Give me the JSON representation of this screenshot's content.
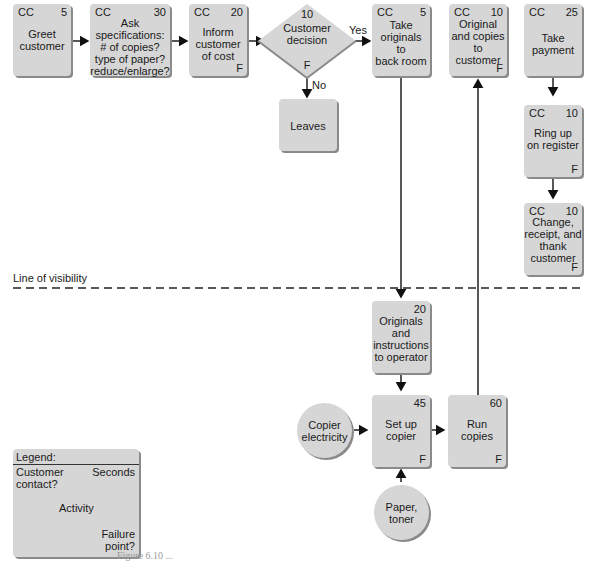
{
  "diagram": {
    "type": "service blueprint",
    "line_of_visibility_label": "Line of visibility",
    "nodes": [
      {
        "id": "greet",
        "cc": "CC",
        "seconds": "5",
        "label": "Greet\ncustomer",
        "failure": ""
      },
      {
        "id": "ask",
        "cc": "CC",
        "seconds": "30",
        "label": "Ask\nspecifications:\n# of copies?\ntype of paper?\nreduce/enlarge?",
        "failure": ""
      },
      {
        "id": "inform",
        "cc": "CC",
        "seconds": "20",
        "label": "Inform\ncustomer\nof cost",
        "failure": "F"
      },
      {
        "id": "decision",
        "cc": "",
        "seconds": "10",
        "label": "Customer\ndecision",
        "failure": "F"
      },
      {
        "id": "leaves",
        "cc": "",
        "seconds": "",
        "label": "Leaves",
        "failure": ""
      },
      {
        "id": "take_originals",
        "cc": "CC",
        "seconds": "5",
        "label": "Take\noriginals\nto\nback room",
        "failure": ""
      },
      {
        "id": "original_copies",
        "cc": "CC",
        "seconds": "10",
        "label": "Original\nand copies\nto\ncustomer",
        "failure": "F"
      },
      {
        "id": "take_payment",
        "cc": "CC",
        "seconds": "25",
        "label": "Take\npayment",
        "failure": ""
      },
      {
        "id": "ring_up",
        "cc": "CC",
        "seconds": "10",
        "label": "Ring up\non register",
        "failure": "F"
      },
      {
        "id": "change_receipt",
        "cc": "CC",
        "seconds": "10",
        "label": "Change,\nreceipt, and\nthank\ncustomer",
        "failure": "F"
      },
      {
        "id": "originals_operator",
        "cc": "",
        "seconds": "20",
        "label": "Originals\nand\ninstructions\nto operator",
        "failure": ""
      },
      {
        "id": "setup_copier",
        "cc": "",
        "seconds": "45",
        "label": "Set up\ncopier",
        "failure": "F"
      },
      {
        "id": "run_copies",
        "cc": "",
        "seconds": "60",
        "label": "Run\ncopies",
        "failure": "F"
      },
      {
        "id": "copier_electricity",
        "cc": "",
        "seconds": "",
        "label": "Copier\nelectricity",
        "failure": ""
      },
      {
        "id": "paper_toner",
        "cc": "",
        "seconds": "",
        "label": "Paper,\ntoner",
        "failure": ""
      }
    ],
    "edge_labels": {
      "yes": "Yes",
      "no": "No"
    },
    "legend": {
      "title": "Legend:",
      "customer_contact": "Customer\ncontact?",
      "seconds": "Seconds",
      "activity": "Activity",
      "failure_point": "Failure\npoint?"
    },
    "caption": "Figure 6.10 ..."
  }
}
